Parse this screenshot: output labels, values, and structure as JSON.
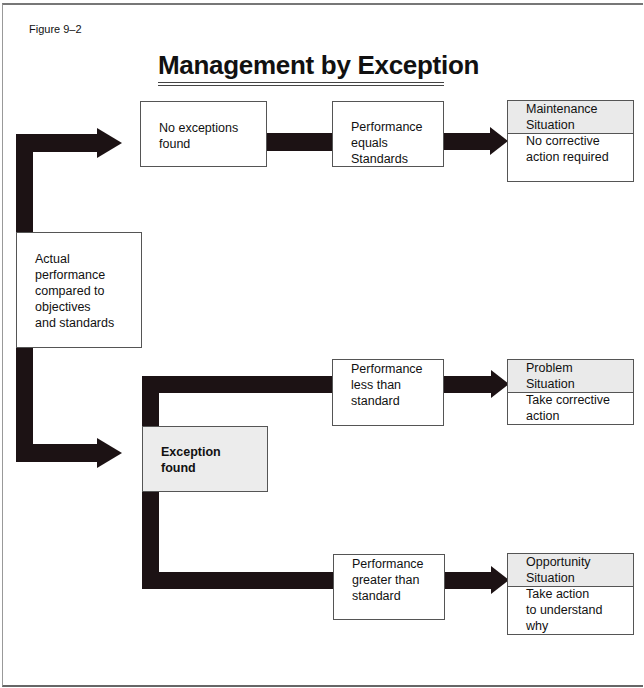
{
  "figure_label": "Figure 9–2",
  "title": "Management by Exception",
  "nodes": {
    "start": "Actual\nperformance\ncompared to\nobjectives\nand standards",
    "no_exceptions": "No exceptions\nfound",
    "equals": "Performance\nequals\nStandards",
    "exception_found": "Exception\nfound",
    "less_than": "Performance\nless than\nstandard",
    "greater_than": "Performance\ngreater than\nstandard"
  },
  "situations": {
    "maintenance": {
      "header": "Maintenance\nSituation",
      "body": "No corrective\naction required"
    },
    "problem": {
      "header": "Problem\nSituation",
      "body": "Take corrective\naction"
    },
    "opportunity": {
      "header": "Opportunity\nSituation",
      "body": "Take action\nto understand\nwhy"
    }
  },
  "colors": {
    "arrow": "#1c1214",
    "shaded_box": "#ececec",
    "border": "#555555"
  }
}
